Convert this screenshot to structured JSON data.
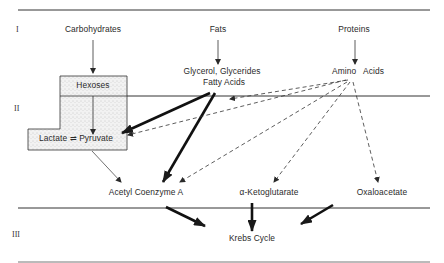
{
  "diagram": {
    "levels": [
      {
        "id": "I",
        "label": "I"
      },
      {
        "id": "II",
        "label": "II"
      },
      {
        "id": "III",
        "label": "III"
      }
    ],
    "nodes": {
      "carbohydrates": "Carbohydrates",
      "fats": "Fats",
      "proteins": "Proteins",
      "hexoses": "Hexoses",
      "glycerol_line1": "Glycerol, Glycerides",
      "glycerol_line2": "Fatty Acids",
      "amino_acids": "Amino   Acids",
      "lactate_pyruvate": "Lactate ⇌ Pyruvate",
      "acetyl_coa": "Acetyl Coenzyme A",
      "ketoglutarate": "α-Ketoglutarate",
      "oxaloacetate": "Oxaloacetate",
      "krebs": "Krebs Cycle"
    },
    "edges": [
      {
        "from": "Carbohydrates",
        "to": "Hexoses",
        "style": "thin"
      },
      {
        "from": "Fats",
        "to": "Glycerol, Glycerides / Fatty Acids",
        "style": "thin"
      },
      {
        "from": "Proteins",
        "to": "Amino Acids",
        "style": "thin"
      },
      {
        "from": "Hexoses",
        "to": "Lactate ⇌ Pyruvate",
        "style": "thin"
      },
      {
        "from": "Glycerol, Glycerides / Fatty Acids",
        "to": "Lactate ⇌ Pyruvate",
        "style": "bold"
      },
      {
        "from": "Glycerol, Glycerides / Fatty Acids",
        "to": "Acetyl Coenzyme A",
        "style": "bold"
      },
      {
        "from": "Amino Acids",
        "to": "Lactate ⇌ Pyruvate",
        "style": "dashed"
      },
      {
        "from": "Amino Acids",
        "to": "Acetyl Coenzyme A",
        "style": "dashed"
      },
      {
        "from": "Amino Acids",
        "to": "α-Ketoglutarate",
        "style": "dashed"
      },
      {
        "from": "Amino Acids",
        "to": "Oxaloacetate",
        "style": "dashed"
      },
      {
        "from": "Amino Acids",
        "to": "Glycerol, Glycerides / Fatty Acids",
        "style": "dashed"
      },
      {
        "from": "Lactate ⇌ Pyruvate",
        "to": "Acetyl Coenzyme A",
        "style": "thin"
      },
      {
        "from": "Acetyl Coenzyme A",
        "to": "Krebs Cycle",
        "style": "bold"
      },
      {
        "from": "α-Ketoglutarate",
        "to": "Krebs Cycle",
        "style": "bold"
      },
      {
        "from": "Oxaloacetate",
        "to": "Krebs Cycle",
        "style": "bold"
      }
    ],
    "colors": {
      "line": "#2a2a2a",
      "box_fill": "#efefef",
      "background": "#ffffff"
    }
  }
}
